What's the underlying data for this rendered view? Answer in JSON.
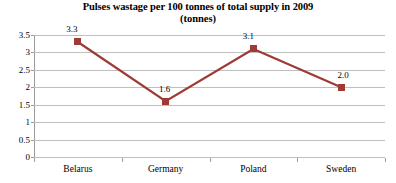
{
  "chart_data": {
    "type": "line",
    "title": "Pulses wastage per 100 tonnes of total supply in 2009",
    "subtitle": "(tonnes)",
    "xlabel": "",
    "ylabel": "",
    "categories": [
      "Belarus",
      "Germany",
      "Poland",
      "Sweden"
    ],
    "values": [
      3.3,
      1.6,
      3.1,
      2.0
    ],
    "data_labels": [
      "3.3",
      "1.6",
      "3.1",
      "2.0"
    ],
    "ylim": [
      0,
      3.5
    ],
    "ytick_labels": [
      "3.5",
      "3",
      "2.5",
      "2",
      "1.5",
      "1",
      "0.5",
      "0"
    ],
    "ytick_values": [
      3.5,
      3,
      2.5,
      2,
      1.5,
      1,
      0.5,
      0
    ],
    "grid": "horizontal",
    "legend": "none",
    "series_color": "#9E3B36",
    "gridline_color": "#BFBFBF",
    "axis_color": "#9A9A9A",
    "marker": "square"
  }
}
